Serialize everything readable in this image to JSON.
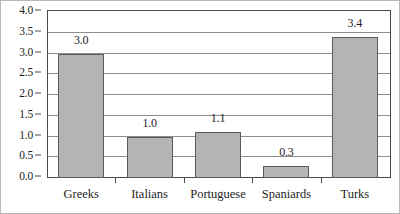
{
  "chart_data": {
    "type": "bar",
    "title": "",
    "xlabel": "",
    "ylabel": "",
    "categories": [
      "Greeks",
      "Italians",
      "Portuguese",
      "Spaniards",
      "Turks"
    ],
    "values": [
      3.0,
      1.0,
      1.1,
      0.3,
      3.4
    ],
    "value_labels": [
      "3.0",
      "1.0",
      "1.1",
      "0.3",
      "3.4"
    ],
    "ylim": [
      0.0,
      4.0
    ],
    "ytick_values": [
      0.0,
      0.5,
      1.0,
      1.5,
      2.0,
      2.5,
      3.0,
      3.5,
      4.0
    ],
    "ytick_labels": [
      "0.0",
      "0.5",
      "1.0",
      "1.5",
      "2.0",
      "2.5",
      "3.0",
      "3.5",
      "4.0"
    ],
    "grid": true,
    "grid_axis": "y",
    "legend": false,
    "legend_position": "none",
    "bar_fill_color": "#b4b4b4",
    "bar_edge_color": "#5a5a5a",
    "gridline_color": "#8d8d8d",
    "axis_color": "#4a4a4a",
    "text_color": "#1d1d1d",
    "background_color": "#ffffff"
  }
}
